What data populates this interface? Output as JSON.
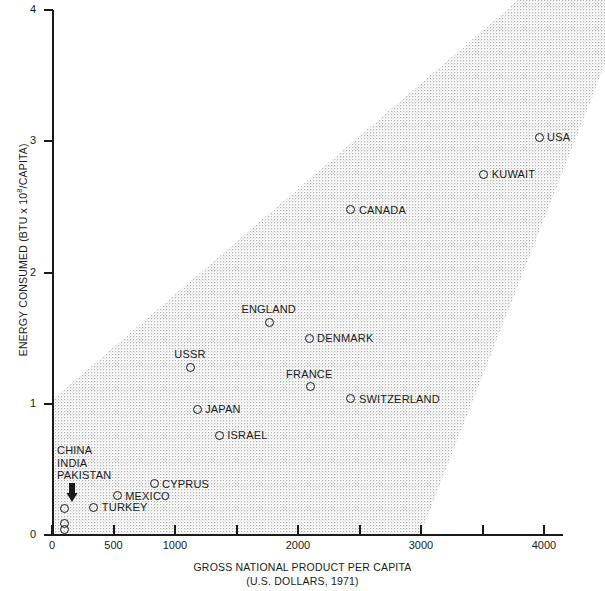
{
  "chart_data": {
    "type": "scatter",
    "title": "",
    "xlabel": "GROSS NATIONAL PRODUCT PER CAPITA",
    "xlabel_sub": "(U.S. DOLLARS, 1971)",
    "ylabel": "ENERGY CONSUMED (BTU x 10",
    "ylabel_exp": "8",
    "ylabel_tail": "/CAPITA)",
    "xlim": [
      0,
      4100
    ],
    "ylim": [
      0,
      4
    ],
    "grid": false,
    "legend": "none",
    "xticks": [
      0,
      500,
      1000,
      1500,
      2000,
      2500,
      3000,
      3500,
      4000
    ],
    "xtick_labels": [
      "0",
      "500",
      "1000",
      "",
      "2000",
      "",
      "3000",
      "",
      "4000"
    ],
    "yticks": [
      0,
      1,
      2,
      3,
      4
    ],
    "ytick_labels": [
      "0",
      "1",
      "2",
      "3",
      "4"
    ],
    "points": [
      {
        "name": "USA",
        "x": 3960,
        "y": 3.03,
        "label_pos": "right"
      },
      {
        "name": "KUWAIT",
        "x": 3510,
        "y": 2.75,
        "label_pos": "right"
      },
      {
        "name": "CANADA",
        "x": 2430,
        "y": 2.48,
        "label_pos": "right"
      },
      {
        "name": "ENGLAND",
        "x": 1770,
        "y": 1.62,
        "label_pos": "above"
      },
      {
        "name": "DENMARK",
        "x": 2090,
        "y": 1.5,
        "label_pos": "right"
      },
      {
        "name": "USSR",
        "x": 1130,
        "y": 1.28,
        "label_pos": "above"
      },
      {
        "name": "FRANCE",
        "x": 2100,
        "y": 1.13,
        "label_pos": "above"
      },
      {
        "name": "SWITZERLAND",
        "x": 2430,
        "y": 1.04,
        "label_pos": "right"
      },
      {
        "name": "JAPAN",
        "x": 1180,
        "y": 0.96,
        "label_pos": "right"
      },
      {
        "name": "ISRAEL",
        "x": 1360,
        "y": 0.76,
        "label_pos": "right"
      },
      {
        "name": "CYPRUS",
        "x": 830,
        "y": 0.39,
        "label_pos": "right"
      },
      {
        "name": "MEXICO",
        "x": 530,
        "y": 0.3,
        "label_pos": "right"
      },
      {
        "name": "TURKEY",
        "x": 340,
        "y": 0.21,
        "label_pos": "right"
      },
      {
        "name": "CHINA",
        "x": 100,
        "y": 0.2,
        "label_pos": "callout"
      },
      {
        "name": "INDIA",
        "x": 100,
        "y": 0.09,
        "label_pos": "callout"
      },
      {
        "name": "PAKISTAN",
        "x": 100,
        "y": 0.04,
        "label_pos": "callout"
      }
    ],
    "cluster_callout": {
      "lines": [
        "CHINA",
        "INDIA",
        "PAKISTAN"
      ],
      "arrow": "down-arrow"
    },
    "band": {
      "description": "stippled diagonal correlation band",
      "fill": "#e8e8e8"
    }
  },
  "colors": {
    "axis": "#1a1a1a",
    "marker_stroke": "#1a1a1a",
    "band_fill": "#e9e9e9",
    "background": "#ffffff"
  }
}
